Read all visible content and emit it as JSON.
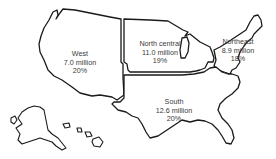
{
  "map": {
    "title": "United States census regions",
    "regions": [
      {
        "name": "West",
        "population": "7.0 million",
        "percent": "20%"
      },
      {
        "name": "North central",
        "population": "11.0 million",
        "percent": "19%"
      },
      {
        "name": "Northeast",
        "population": "8.9 million",
        "percent": "18%"
      },
      {
        "name": "South",
        "population": "12.6 million",
        "percent": "20%"
      }
    ],
    "insets": [
      "Alaska",
      "Hawaii"
    ],
    "colors": {
      "outline": "#1a1a1a",
      "fill": "#ffffff",
      "text": "#3a3a3a"
    }
  }
}
